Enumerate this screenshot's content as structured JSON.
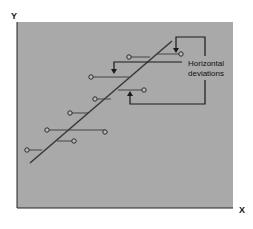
{
  "figure": {
    "title": "",
    "axes": {
      "x_label": "X",
      "y_label": "Y"
    },
    "annotation": {
      "line1": "Horizontal",
      "line2": "deviations"
    },
    "colors": {
      "plot_background": "#a9a9a9",
      "page_background": "#ffffff",
      "line": "#3a3a3a",
      "points_fill": "#bdbdbd",
      "text": "#111111"
    },
    "regression_line": {
      "x1": 30,
      "y1": 163,
      "x2": 172,
      "y2": 41
    },
    "points": [
      {
        "x": 181,
        "y": 54,
        "line_x": 157
      },
      {
        "x": 129,
        "y": 57,
        "line_x": 150
      },
      {
        "x": 91,
        "y": 77,
        "line_x": 129
      },
      {
        "x": 144,
        "y": 90,
        "line_x": 118
      },
      {
        "x": 95,
        "y": 99,
        "line_x": 111
      },
      {
        "x": 70,
        "y": 113,
        "line_x": 88
      },
      {
        "x": 47,
        "y": 130,
        "line_x": 69
      },
      {
        "x": 105,
        "y": 132,
        "line_x": 69
      },
      {
        "x": 74,
        "y": 141,
        "line_x": 57
      },
      {
        "x": 27,
        "y": 150,
        "line_x": 42
      }
    ]
  }
}
